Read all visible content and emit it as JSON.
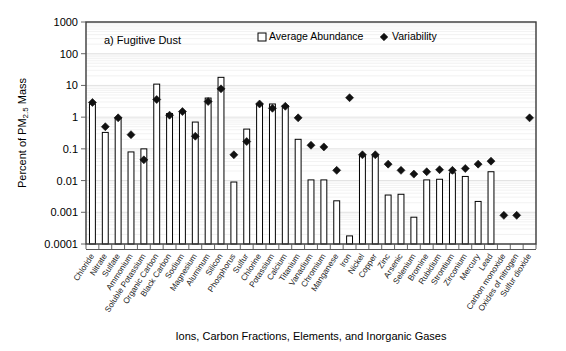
{
  "figure": {
    "panel_label": "a) Fugitive Dust",
    "ylabel_main": "Percent of PM",
    "ylabel_sub": "2.5",
    "ylabel_tail": " Mass",
    "xlabel": "Ions, Carbon Fractions, Elements, and Inorganic Gases",
    "legend": [
      {
        "key": "average-abundance",
        "label": "Average Abundance",
        "marker": "open-square",
        "color": "#ffffff"
      },
      {
        "key": "variability",
        "label": "Variability",
        "marker": "filled-diamond",
        "color": "#111111"
      }
    ]
  },
  "chart_data": {
    "type": "bar",
    "title": "a) Fugitive Dust",
    "xlabel": "Ions, Carbon Fractions, Elements, and Inorganic Gases",
    "ylabel": "Percent of PM2.5 Mass",
    "yscale": "log",
    "ylim": [
      0.0001,
      1000
    ],
    "ytick_labels": [
      "1000",
      "100",
      "10",
      "1",
      "0.1",
      "0.01",
      "0.001",
      "0.0001"
    ],
    "ytick_values": [
      1000,
      100,
      10,
      1,
      0.1,
      0.01,
      0.001,
      0.0001
    ],
    "grid": true,
    "legend_position": "top-right-inside",
    "categories": [
      "Chloride",
      "Nitrate",
      "Sulfate",
      "Ammonium",
      "Soluble Potassium",
      "Organic Carbon",
      "Black Carbon",
      "Sodium",
      "Magnesium",
      "Aluminum",
      "Silicon",
      "Phosphorus",
      "Sulfur",
      "Chlorine",
      "Potassium",
      "Calcium",
      "Titanium",
      "Vanadium",
      "Chromium",
      "Manganese",
      "Iron",
      "Nickel",
      "Copper",
      "Zinc",
      "Arsenic",
      "Selenium",
      "Bromine",
      "Rubidium",
      "Strontium",
      "Zirconium",
      "Mercury",
      "Lead",
      "Carbon monoxide",
      "Oxides of nitrogen",
      "Sulfur dioxide"
    ],
    "series": [
      {
        "name": "Average Abundance",
        "marker": "open-square",
        "values": [
          2.6,
          0.33,
          0.95,
          0.08,
          0.1,
          11.0,
          1.3,
          1.4,
          0.7,
          4.0,
          18.0,
          0.009,
          0.42,
          2.6,
          2.6,
          2.3,
          0.2,
          0.0105,
          0.0105,
          0.0023,
          0.00018,
          0.06,
          0.06,
          0.0035,
          0.0037,
          0.0007,
          0.0105,
          0.011,
          0.0175,
          0.0135,
          0.0022,
          0.019,
          null,
          null,
          null
        ]
      },
      {
        "name": "Variability",
        "marker": "filled-diamond",
        "values": [
          2.9,
          0.5,
          0.95,
          0.28,
          0.045,
          3.6,
          1.15,
          1.5,
          0.25,
          3.1,
          7.8,
          0.065,
          0.17,
          2.6,
          1.9,
          2.2,
          0.95,
          0.13,
          0.115,
          0.021,
          4.1,
          0.065,
          0.065,
          0.033,
          0.021,
          0.016,
          0.019,
          0.022,
          0.021,
          0.024,
          0.033,
          0.041,
          0.0008,
          0.0008,
          0.95
        ]
      }
    ]
  }
}
